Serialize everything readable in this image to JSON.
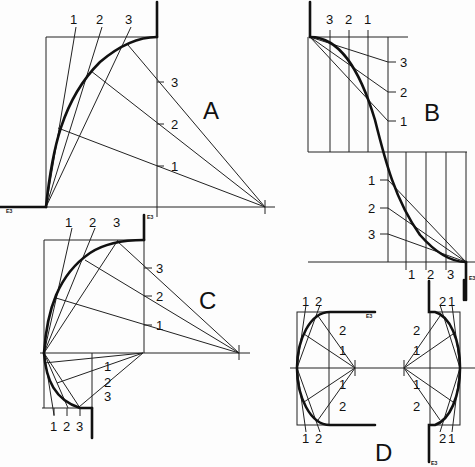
{
  "figure": {
    "panels": [
      {
        "id": "A",
        "label": "A",
        "top_labels": [
          "1",
          "2",
          "3"
        ],
        "side_labels": [
          "3",
          "2",
          "1"
        ]
      },
      {
        "id": "B",
        "label": "B",
        "top_labels": [
          "3",
          "2",
          "1"
        ],
        "side_labels": [
          "3",
          "2",
          "1"
        ],
        "lower_side_labels": [
          "1",
          "2",
          "3"
        ],
        "lower_bottom_labels": [
          "1",
          "2",
          "3"
        ]
      },
      {
        "id": "C",
        "label": "C",
        "top_labels": [
          "1",
          "2",
          "3"
        ],
        "side_labels": [
          "3",
          "2",
          "1"
        ],
        "lower_side_labels": [
          "1",
          "2",
          "3"
        ],
        "lower_bottom_labels": [
          "1",
          "2",
          "3"
        ]
      },
      {
        "id": "D",
        "label": "D",
        "left_top_labels": [
          "1",
          "2"
        ],
        "left_bottom_labels": [
          "1",
          "2"
        ],
        "left_side_labels": [
          "2",
          "1",
          "1",
          "2"
        ],
        "right_top_labels": [
          "2",
          "1"
        ],
        "right_bottom_labels": [
          "2",
          "1"
        ],
        "right_side_labels": [
          "2",
          "1",
          "1",
          "2"
        ]
      }
    ],
    "stroke_color": "#111111",
    "background": "#fdfdfd"
  }
}
